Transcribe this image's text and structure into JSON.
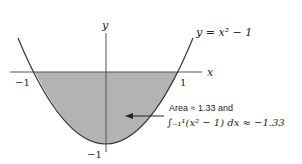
{
  "figure": {
    "function_label": "y = x² − 1",
    "x_axis_label": "x",
    "y_axis_label": "y",
    "tick_x_neg": "−1",
    "tick_x_pos": "1",
    "tick_y_neg": "−1",
    "annotation_line1": "Area ≈ 1.33 and",
    "annotation_line2": "∫₋₁¹(x² − 1) dx ≈ −1.33",
    "colors": {
      "fill": "#b3b3b3",
      "curve": "#333333",
      "axis": "#555555"
    }
  }
}
